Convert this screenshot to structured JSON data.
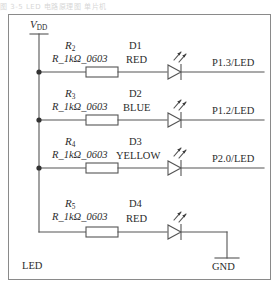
{
  "page": {
    "header_noise": "图 3-5  LED 电路原理图                    单片机"
  },
  "schematic": {
    "title": "LED",
    "supply": {
      "label": "VDD",
      "symbol": "V",
      "subscript": "DD"
    },
    "ground": {
      "label": "GND"
    },
    "rows": [
      {
        "resistor_ref": "R",
        "resistor_sub": "2",
        "resistor_value": "R_1kΩ_0603",
        "led_ref": "D1",
        "led_color": "RED",
        "net": "P1.3/LED"
      },
      {
        "resistor_ref": "R",
        "resistor_sub": "3",
        "resistor_value": "R_1kΩ_0603",
        "led_ref": "D2",
        "led_color": "BLUE",
        "net": "P1.2/LED"
      },
      {
        "resistor_ref": "R",
        "resistor_sub": "4",
        "resistor_value": "R_1kΩ_0603",
        "led_ref": "D3",
        "led_color": "YELLOW",
        "net": "P2.0/LED"
      },
      {
        "resistor_ref": "R",
        "resistor_sub": "5",
        "resistor_value": "R_1kΩ_0603",
        "led_ref": "D4",
        "led_color": "RED",
        "net": "GND"
      }
    ],
    "colors": {
      "wire": "#555555",
      "frame": "#8a8a8a",
      "text": "#2b2b2b"
    }
  }
}
